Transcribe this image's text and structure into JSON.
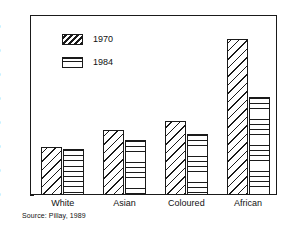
{
  "chart_data": {
    "type": "bar",
    "title": "",
    "subtitle": "",
    "xlabel": "",
    "ylabel": "",
    "categories": [
      "White",
      "Asian",
      "Coloured",
      "African"
    ],
    "series": [
      {
        "name": "1970",
        "values": [
          20,
          27,
          31,
          65
        ],
        "pattern": "diagonal-hatch"
      },
      {
        "name": "1984",
        "values": [
          19,
          23,
          25.5,
          41
        ],
        "pattern": "horizontal-lines"
      }
    ],
    "ylim": [
      0,
      75
    ],
    "yticks": [
      0,
      10,
      20,
      30,
      40,
      50,
      60,
      70
    ],
    "ytick_labels": [
      "0",
      "10",
      "20",
      "30",
      "40",
      "50",
      "60",
      "70"
    ],
    "grid": false,
    "legend_position": "upper-left-inside",
    "source_note": "Source: Pillay, 1989",
    "colors": {
      "ink": "#1a1a1a",
      "background": "#ffffff"
    }
  }
}
